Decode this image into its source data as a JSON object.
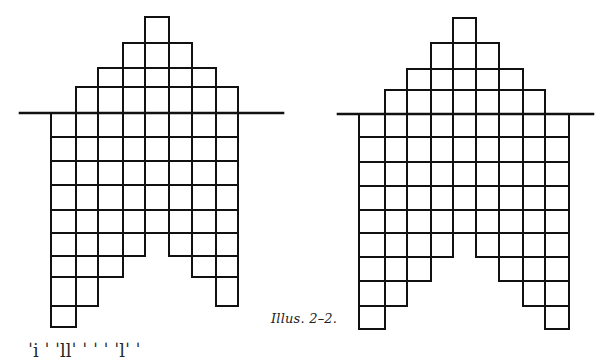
{
  "illustration": {
    "caption": "Illus. 2–2.",
    "stroke_color": "#111111",
    "background": "#ffffff",
    "figures": [
      {
        "name": "left-staircase-figure",
        "baseline": {
          "y": 113,
          "x1": 20,
          "x2": 283
        },
        "column_x": [
          51,
          76,
          98,
          123,
          145,
          169,
          192,
          216,
          238
        ],
        "row_y_below": [
          113,
          137,
          161,
          185,
          210,
          233,
          256,
          277,
          306,
          327
        ],
        "row_y_above": [
          113,
          87,
          68,
          43,
          17
        ],
        "column_bottom_index": [
          9,
          8,
          7,
          6,
          5,
          6,
          7,
          8
        ],
        "column_top_index": [
          0,
          1,
          2,
          3,
          4,
          3,
          2,
          1
        ]
      },
      {
        "name": "right-staircase-figure",
        "baseline": {
          "y": 114,
          "x1": 338,
          "x2": 593
        },
        "column_x": [
          359,
          385,
          407,
          431,
          453,
          476,
          499,
          523,
          545,
          569
        ],
        "row_y_below": [
          114,
          137,
          162,
          186,
          210,
          233,
          257,
          281,
          306,
          329
        ],
        "row_y_above": [
          114,
          90,
          69,
          43,
          18
        ],
        "column_bottom_index": [
          9,
          8,
          7,
          6,
          5,
          6,
          7,
          8,
          9
        ],
        "column_top_index": [
          0,
          1,
          2,
          3,
          4,
          3,
          2,
          1,
          0
        ]
      }
    ]
  },
  "cutoff_line_text": "ˈi       ˈ  ˈllˈ  ˈ    ˈ     ˈ    ˈlˈ     ˈ"
}
